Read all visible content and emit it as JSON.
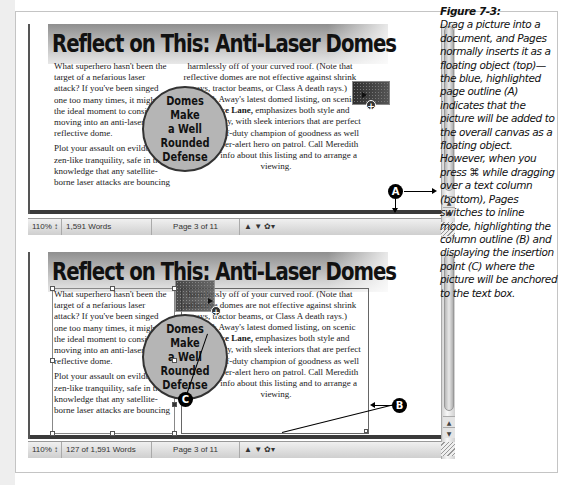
{
  "figure": {
    "title": "Figure 7-3:",
    "caption": "Drag a picture into a document, and Pages normally inserts it as a floating object (top)—the blue, highlighted page outline (A) indicates that the picture will be added to the overall canvas as a floating object. However, when you press ⌘ while dragging over a text column (bottom), Pages switches to inline mode, highlighting the column outline (B) and displaying the insertion point (C) where the picture will be anchored to the text box."
  },
  "document": {
    "headline": "Reflect on This: Anti-Laser Domes",
    "column1": {
      "paragraph1": "What superhero hasn't been the target of a nefarious laser attack? If you've been singed one too many times, it might be the ideal moment to consider moving into an anti-laser reflective dome.",
      "paragraph2": "Plot your assault on evildoers in zen-like tranquility, safe in the knowledge that any satellite-borne laser attacks are bouncing"
    },
    "column2": {
      "paragraph1": "harmlessly off of your curved roof. (Note that reflective domes are not effective against shrink rays, tractor beams, or Class A death rays.)",
      "paragraph2_prefix": "Up & Away's latest domed listing, on scenic ",
      "paragraph2_bold": "Justice Lane,",
      "paragraph2_suffix": " emphasizes both style and practicality, with sleek interiors that are perfect for the off-duty champion of goodness as well as the ever-alert hero on patrol. Call Meredith M. for info about this listing and to arrange a viewing."
    },
    "pull_quote": "Domes Make\na Well Rounded\nDefense"
  },
  "top_window": {
    "status": {
      "zoom": "110%",
      "zoom_arrow": "↕",
      "word_count": "1,591 Words",
      "page": "Page 3 of 11",
      "nav": "▲ ▼ ✿▾"
    },
    "callout": "A"
  },
  "bottom_window": {
    "status": {
      "zoom": "110%",
      "zoom_arrow": "↕",
      "word_count": "127 of 1,591 Words",
      "page": "Page 3 of 11",
      "nav": "▲ ▼ ✿▾"
    },
    "callouts": [
      "B",
      "C"
    ]
  },
  "scroll": {
    "up": "▲",
    "down": "▼"
  },
  "cursor": {
    "plus": "+"
  }
}
